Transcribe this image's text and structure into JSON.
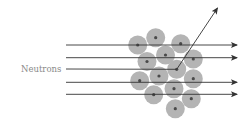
{
  "diagram": {
    "label": "Neutrons",
    "colors": {
      "background": "#ffffff",
      "nucleus_fill": "#b4b4b4",
      "nucleus_core": "#4a4a4a",
      "line": "#333333",
      "label": "#8a8a8a"
    },
    "neutron_lines_y": [
      45,
      57.7,
      69,
      82.3,
      94.3
    ],
    "line_start_x": 66,
    "line_end_x": 237,
    "scattered_line_index": 2,
    "scatter_point": [
      176.7,
      69.3
    ],
    "scatter_tip": [
      217.5,
      8
    ],
    "nuclei": [
      [
        137.7,
        45
      ],
      [
        155.7,
        37.7
      ],
      [
        180.7,
        43.7
      ],
      [
        165.5,
        55
      ],
      [
        147,
        61.5
      ],
      [
        193.3,
        59
      ],
      [
        176.7,
        69.3
      ],
      [
        159,
        76
      ],
      [
        139.7,
        80.7
      ],
      [
        193.3,
        78.7
      ],
      [
        174,
        88.7
      ],
      [
        153.7,
        94.7
      ],
      [
        191.3,
        98.7
      ],
      [
        175.3,
        108.7
      ]
    ],
    "nucleus_radius": 9.5,
    "core_radius": 1.6
  }
}
